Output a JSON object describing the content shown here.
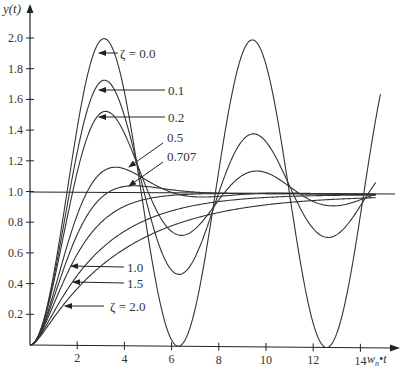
{
  "chart_data": {
    "type": "line",
    "title": "",
    "xlabel": "w_n•t",
    "ylabel": "y(t)",
    "xlim": [
      0,
      15
    ],
    "ylim": [
      0,
      2.1
    ],
    "grid": false,
    "legend_position": "inline annotations with arrows",
    "x_ticks": [
      2,
      4,
      6,
      8,
      10,
      12,
      14
    ],
    "x_tick_labels": [
      "2",
      "4",
      "6",
      "8",
      "10",
      "12",
      "14"
    ],
    "y_ticks": [
      0.2,
      0.4,
      0.6,
      0.8,
      1.0,
      1.2,
      1.4,
      1.6,
      1.8,
      2.0
    ],
    "y_tick_labels": [
      "0.2",
      "0.4",
      "0.6",
      "0.8",
      "1.0",
      "1.2",
      "1.4",
      "1.6",
      "1.8",
      "2.0"
    ],
    "reference_line": {
      "y": 1.0
    },
    "series": [
      {
        "name": "ζ = 0.0",
        "zeta": 0.0,
        "peak": {
          "x": 3.14,
          "y": 2.0
        }
      },
      {
        "name": "0.1",
        "zeta": 0.1,
        "peak": {
          "x": 3.16,
          "y": 1.73
        }
      },
      {
        "name": "0.2",
        "zeta": 0.2,
        "peak": {
          "x": 3.21,
          "y": 1.53
        }
      },
      {
        "name": "0.5",
        "zeta": 0.5,
        "peak": {
          "x": 3.63,
          "y": 1.16
        }
      },
      {
        "name": "0.707",
        "zeta": 0.707,
        "peak": {
          "x": 4.44,
          "y": 1.04
        }
      },
      {
        "name": "1.0",
        "zeta": 1.0
      },
      {
        "name": "1.5",
        "zeta": 1.5
      },
      {
        "name": "ζ = 2.0",
        "zeta": 2.0
      }
    ],
    "annotations": [
      {
        "text": "ζ = 0.0",
        "label_x": 120,
        "label_y": 57,
        "arrow_to": [
          98,
          53
        ]
      },
      {
        "text": "0.1",
        "label_x": 170,
        "label_y": 94,
        "arrow_to": [
          98,
          90
        ]
      },
      {
        "text": "0.2",
        "label_x": 170,
        "label_y": 122,
        "arrow_to": [
          98,
          117
        ]
      },
      {
        "text": "0.5",
        "label_x": 168,
        "label_y": 142,
        "arrow_to": [
          128,
          168
        ]
      },
      {
        "text": "0.707",
        "label_x": 168,
        "label_y": 161,
        "arrow_to": [
          128,
          187
        ]
      },
      {
        "text": "1.0",
        "label_x": 105,
        "label_y": 271,
        "arrow_to": [
          70,
          266
        ]
      },
      {
        "text": "1.5",
        "label_x": 105,
        "label_y": 287,
        "arrow_to": [
          73,
          282
        ]
      },
      {
        "text": "ζ = 2.0",
        "label_x": 80,
        "label_y": 311,
        "arrow_to": [
          64,
          306
        ]
      }
    ]
  },
  "axes": {
    "y_label": "y(t)",
    "x_label_main": "w",
    "x_label_sub": "n",
    "x_label_tail": "•t"
  },
  "labels": {
    "z00": "ζ = 0.0",
    "z01": "0.1",
    "z02": "0.2",
    "z05": "0.5",
    "z0707": "0.707",
    "z10": "1.0",
    "z15": "1.5",
    "z20": "ζ = 2.0"
  }
}
